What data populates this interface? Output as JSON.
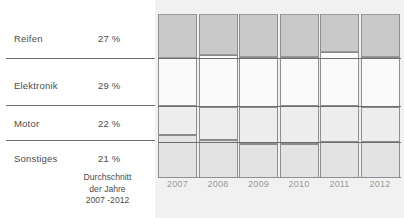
{
  "categories": [
    {
      "label": "Reifen",
      "percent": "27 %"
    },
    {
      "label": "Elektronik",
      "percent": "29 %"
    },
    {
      "label": "Motor",
      "percent": "22 %"
    },
    {
      "label": "Sonstiges",
      "percent": "21 %"
    }
  ],
  "caption": {
    "line1": "Durchschnitt",
    "line2": "der Jahre",
    "line3": "2007 -2012"
  },
  "chart_data": {
    "type": "bar",
    "subtype": "stacked-column-100",
    "title": "",
    "xlabel": "",
    "ylabel": "",
    "ylim": [
      0,
      100
    ],
    "grid": true,
    "legend": "left-panel",
    "categories": [
      "2007",
      "2008",
      "2009",
      "2010",
      "2011",
      "2012"
    ],
    "series": [
      {
        "name": "Reifen",
        "average": 27,
        "color": "#c9c9c9",
        "values": [
          27,
          25,
          26,
          26,
          23,
          26
        ]
      },
      {
        "name": "Elektronik",
        "average": 29,
        "color": "#fafafa",
        "values": [
          29,
          32,
          31,
          30,
          33,
          31
        ]
      },
      {
        "name": "Motor",
        "average": 22,
        "color": "#ededed",
        "values": [
          18,
          20,
          22,
          23,
          22,
          21
        ]
      },
      {
        "name": "Sonstiges",
        "average": 21,
        "color": "#e3e3e3",
        "values": [
          26,
          23,
          21,
          21,
          22,
          22
        ]
      }
    ]
  }
}
